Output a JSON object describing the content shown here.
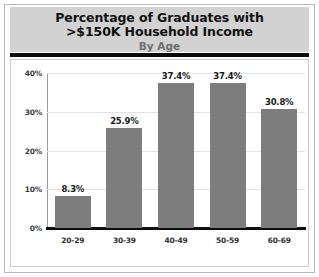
{
  "header": {
    "title_line1": "Percentage of Graduates with",
    "title_line2": ">$150K Household Income",
    "subtitle": "By Age"
  },
  "colors": {
    "bar": "#7d7d7d",
    "header_band": "#d2d2d2",
    "rule": "#0b0b0b",
    "grid": "#e2e2e2",
    "axis": "#0c0c0c",
    "frame": "#b9b9b9"
  },
  "chart_data": {
    "type": "bar",
    "title": "Percentage of Graduates with >$150K Household Income",
    "subtitle": "By Age",
    "xlabel": "",
    "ylabel": "",
    "categories": [
      "20-29",
      "30-39",
      "40-49",
      "50-59",
      "60-69"
    ],
    "values": [
      8.3,
      25.9,
      37.4,
      37.4,
      30.8
    ],
    "value_labels": [
      "8.3%",
      "25.9%",
      "37.4%",
      "37.4%",
      "30.8%"
    ],
    "ylim": [
      0,
      40
    ],
    "yticks": [
      0,
      10,
      20,
      30,
      40
    ],
    "ytick_labels": [
      "0%",
      "10%",
      "20%",
      "30%",
      "40%"
    ],
    "grid": true,
    "legend": false
  }
}
